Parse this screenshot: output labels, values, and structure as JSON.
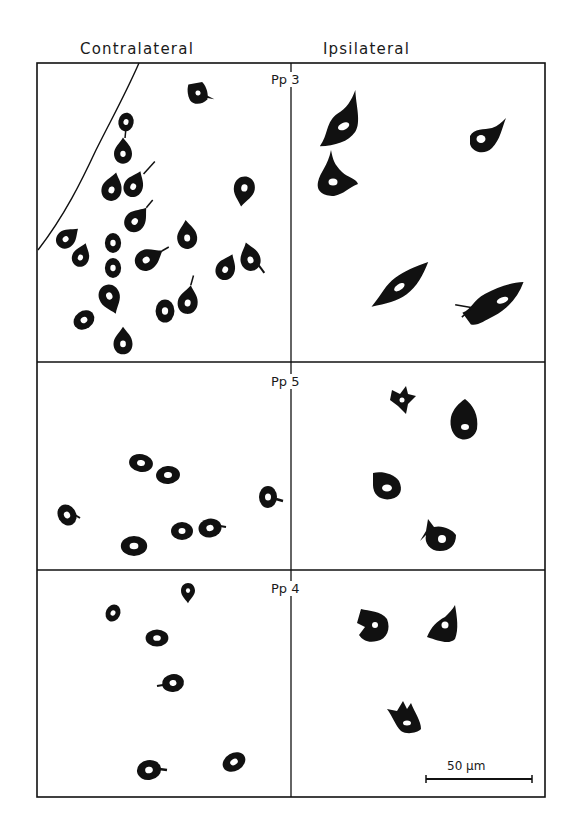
{
  "figure": {
    "column_headers": {
      "left": "Contralateral",
      "right": "Ipsilateral"
    },
    "panels": [
      {
        "label": "Pp 3",
        "contralateral_cell_count": 22,
        "ipsilateral_cell_count": 5
      },
      {
        "label": "Pp 5",
        "contralateral_cell_count": 7,
        "ipsilateral_cell_count": 4
      },
      {
        "label": "Pp 4",
        "contralateral_cell_count": 6,
        "ipsilateral_cell_count": 3
      }
    ],
    "scale_bar": {
      "label": "50 µm"
    },
    "colors": {
      "ink": "#111111",
      "background": "#ffffff"
    }
  }
}
